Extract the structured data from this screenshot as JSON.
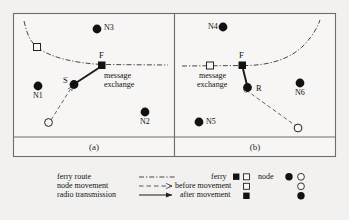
{
  "figure": {
    "panels": [
      {
        "caption": "(a)",
        "nodes": [
          {
            "id": "N3",
            "label": "N3",
            "type": "node-after-movement",
            "label_side": "right"
          },
          {
            "id": "N1",
            "label": "N1",
            "type": "node-after-movement",
            "label_side": "below"
          },
          {
            "id": "N2",
            "label": "N2",
            "type": "node-after-movement",
            "label_side": "below"
          },
          {
            "id": "S",
            "label": "S",
            "type": "node-after-movement",
            "label_side": "left"
          }
        ],
        "ferry": {
          "label": "F",
          "before_symbol": "hollow-square",
          "after_symbol": "filled-square"
        },
        "annotation": [
          "message",
          "exchange"
        ]
      },
      {
        "caption": "(b)",
        "nodes": [
          {
            "id": "N4",
            "label": "N4",
            "type": "node-after-movement",
            "label_side": "left"
          },
          {
            "id": "N5",
            "label": "N5",
            "type": "node-after-movement",
            "label_side": "right"
          },
          {
            "id": "N6",
            "label": "N6",
            "type": "node-after-movement",
            "label_side": "below"
          },
          {
            "id": "R",
            "label": "R",
            "type": "node-after-movement",
            "label_side": "right"
          }
        ],
        "ferry": {
          "label": "F",
          "before_symbol": "hollow-square",
          "after_symbol": "filled-square"
        },
        "annotation": [
          "message",
          "exchange"
        ]
      }
    ]
  },
  "legend": {
    "lines": [
      {
        "label": "ferry route",
        "style": "dash-dot",
        "arrow": false
      },
      {
        "label": "node movement",
        "style": "dashed",
        "arrow": true
      },
      {
        "label": "radio transmission",
        "style": "solid",
        "arrow": true
      }
    ],
    "symbols": {
      "col_headers": [
        {
          "label": "ferry",
          "symbols": [
            "filled-square",
            "hollow-square"
          ]
        },
        {
          "label": "node",
          "symbols": [
            "filled-circle",
            "hollow-circle"
          ]
        }
      ],
      "rows": [
        {
          "label": "before movement",
          "ferry": "hollow-square",
          "node": "hollow-circle"
        },
        {
          "label": "after movement",
          "ferry": "filled-square",
          "node": "filled-circle"
        }
      ]
    }
  },
  "colors": {
    "background": "#f2f1ef",
    "ink": "#1a1a1a",
    "frame": "#6e6e6e"
  }
}
